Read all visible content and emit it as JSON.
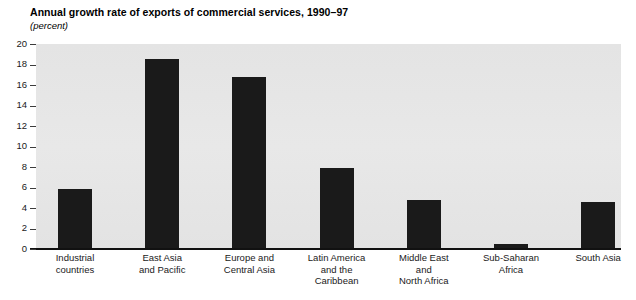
{
  "header": {
    "title": "Annual growth rate of exports of commercial services, 1990–97",
    "subtitle": "(percent)"
  },
  "chart_data": {
    "type": "bar",
    "title": "Annual growth rate of exports of commercial services, 1990–97",
    "subtitle": "(percent)",
    "xlabel": "",
    "ylabel": "",
    "ylim": [
      0,
      20
    ],
    "yticks": [
      0,
      2,
      4,
      6,
      8,
      10,
      12,
      14,
      16,
      18,
      20
    ],
    "ytick_labels": [
      "0",
      "2",
      "4",
      "6",
      "8",
      "10",
      "12",
      "14",
      "16",
      "18",
      "20"
    ],
    "grid": false,
    "legend": null,
    "categories": [
      "Industrial countries",
      "East Asia and Pacific",
      "Europe and Central Asia",
      "Latin America and the Caribbean",
      "Middle East and North Africa",
      "Sub-Saharan Africa",
      "South Asia"
    ],
    "category_lines": [
      [
        "Industrial",
        "countries"
      ],
      [
        "East Asia",
        "and Pacific"
      ],
      [
        "Europe and",
        "Central Asia"
      ],
      [
        "Latin America",
        "and the",
        "Caribbean"
      ],
      [
        "Middle East",
        "and",
        "North Africa"
      ],
      [
        "Sub-Saharan",
        "Africa"
      ],
      [
        "South Asia"
      ]
    ],
    "values": [
      5.9,
      18.5,
      16.8,
      7.9,
      4.8,
      0.5,
      4.6
    ],
    "bar_color": "#1a1a1a",
    "plot_background": "#e6e6e6"
  }
}
